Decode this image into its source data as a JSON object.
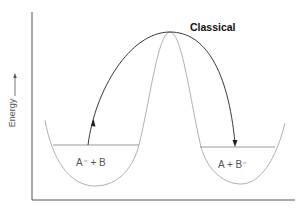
{
  "diagram": {
    "title": "Classical",
    "y_axis_label": "Energy",
    "left_well_label": "A⁻ + B",
    "right_well_label": "A + B⁻",
    "colors": {
      "axes": "#555555",
      "potential_curve": "#b0b0b0",
      "trajectory": "#222222"
    }
  }
}
